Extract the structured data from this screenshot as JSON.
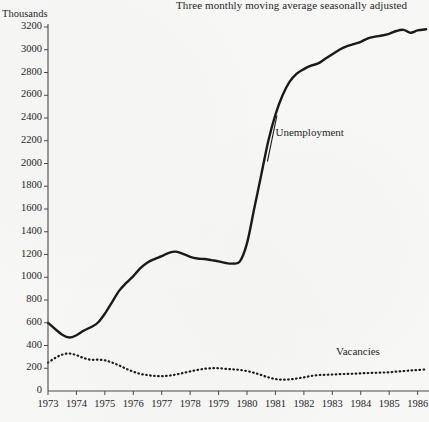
{
  "chart_data": {
    "type": "line",
    "title": "Three monthly moving average seasonally adjusted",
    "ylabel": "Thousands",
    "xlabel": "",
    "grid": false,
    "legend_position": "inline-annotations",
    "xlim": [
      1973,
      1986.4
    ],
    "ylim": [
      0,
      3200
    ],
    "yticks": [
      0,
      200,
      400,
      600,
      800,
      1000,
      1200,
      1400,
      1600,
      1800,
      2000,
      2200,
      2400,
      2600,
      2800,
      3000,
      3200
    ],
    "ytick_labels": [
      "0",
      "200",
      "400",
      "600",
      "800",
      "1000",
      "1200",
      "1400",
      "1600",
      "1800",
      "2000",
      "2200",
      "2400",
      "2600",
      "2800",
      "3000",
      "3200"
    ],
    "xticks": [
      1973,
      1974,
      1975,
      1976,
      1977,
      1978,
      1979,
      1980,
      1981,
      1982,
      1983,
      1984,
      1985,
      1986
    ],
    "xtick_labels": [
      "1973",
      "1974",
      "1975",
      "1976",
      "1977",
      "1978",
      "1979",
      "1980",
      "1981",
      "1982",
      "1983",
      "1984",
      "1985",
      "1986"
    ],
    "series": [
      {
        "name": "Unemployment",
        "style": "solid",
        "color": "#1a1a1a",
        "x": [
          1973.0,
          1973.25,
          1973.5,
          1973.75,
          1974.0,
          1974.25,
          1974.5,
          1974.75,
          1975.0,
          1975.25,
          1975.5,
          1975.75,
          1976.0,
          1976.25,
          1976.5,
          1976.75,
          1977.0,
          1977.25,
          1977.5,
          1977.75,
          1978.0,
          1978.25,
          1978.5,
          1978.75,
          1979.0,
          1979.25,
          1979.5,
          1979.75,
          1980.0,
          1980.25,
          1980.5,
          1980.75,
          1981.0,
          1981.25,
          1981.5,
          1981.75,
          1982.0,
          1982.25,
          1982.5,
          1982.75,
          1983.0,
          1983.25,
          1983.5,
          1983.75,
          1984.0,
          1984.25,
          1984.5,
          1984.75,
          1985.0,
          1985.25,
          1985.5,
          1985.75,
          1986.0,
          1986.3
        ],
        "values": [
          600,
          545,
          495,
          470,
          490,
          530,
          560,
          600,
          680,
          780,
          880,
          950,
          1010,
          1080,
          1130,
          1160,
          1185,
          1215,
          1225,
          1205,
          1180,
          1165,
          1160,
          1150,
          1140,
          1125,
          1120,
          1140,
          1300,
          1600,
          1900,
          2200,
          2430,
          2600,
          2720,
          2790,
          2830,
          2860,
          2880,
          2920,
          2960,
          3000,
          3030,
          3050,
          3070,
          3100,
          3115,
          3125,
          3140,
          3165,
          3175,
          3150,
          3170,
          3180
        ]
      },
      {
        "name": "Vacancies",
        "style": "dotted",
        "color": "#1a1a1a",
        "x": [
          1973.0,
          1973.25,
          1973.5,
          1973.75,
          1974.0,
          1974.25,
          1974.5,
          1974.75,
          1975.0,
          1975.25,
          1975.5,
          1975.75,
          1976.0,
          1976.25,
          1976.5,
          1976.75,
          1977.0,
          1977.25,
          1977.5,
          1977.75,
          1978.0,
          1978.25,
          1978.5,
          1978.75,
          1979.0,
          1979.25,
          1979.5,
          1979.75,
          1980.0,
          1980.25,
          1980.5,
          1980.75,
          1981.0,
          1981.25,
          1981.5,
          1981.75,
          1982.0,
          1982.25,
          1982.5,
          1982.75,
          1983.0,
          1983.25,
          1983.5,
          1983.75,
          1984.0,
          1984.25,
          1984.5,
          1984.75,
          1985.0,
          1985.25,
          1985.5,
          1985.75,
          1986.0,
          1986.3
        ],
        "values": [
          250,
          290,
          320,
          330,
          315,
          290,
          275,
          275,
          270,
          250,
          225,
          195,
          170,
          150,
          140,
          132,
          130,
          135,
          145,
          158,
          172,
          185,
          195,
          200,
          200,
          195,
          190,
          185,
          175,
          160,
          140,
          120,
          105,
          100,
          102,
          110,
          120,
          132,
          140,
          142,
          145,
          148,
          150,
          152,
          155,
          158,
          160,
          162,
          165,
          170,
          175,
          180,
          185,
          190
        ]
      }
    ],
    "annotations": [
      {
        "text": "Unemployment",
        "x": 1981.0,
        "y": 2260
      },
      {
        "text": "Vacancies",
        "x": 1983.9,
        "y": 330
      }
    ]
  }
}
